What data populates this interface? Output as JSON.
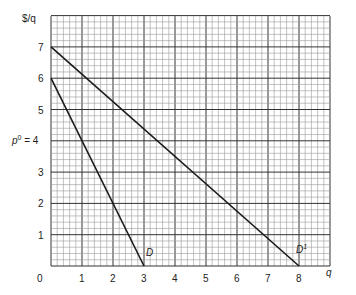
{
  "chart_data": {
    "type": "line",
    "title": "",
    "xlabel": "q",
    "ylabel": "$/q",
    "xlim": [
      0,
      9
    ],
    "ylim": [
      0,
      8
    ],
    "grid": true,
    "grid_minor_per_unit": 5,
    "x_ticks": [
      "0",
      "1",
      "2",
      "3",
      "4",
      "5",
      "6",
      "7",
      "8"
    ],
    "y_ticks": [
      "1",
      "2",
      "3",
      "p⁰ = 4",
      "5",
      "6",
      "7"
    ],
    "series": [
      {
        "name": "D",
        "points": [
          [
            0,
            6
          ],
          [
            3,
            0
          ]
        ]
      },
      {
        "name": "D¹",
        "points": [
          [
            0,
            7
          ],
          [
            8,
            0
          ]
        ]
      }
    ],
    "annotations": [
      {
        "text": "p⁰ = 4",
        "at": "y-axis label at 4"
      },
      {
        "text": "D",
        "near": [
          3,
          0.3
        ]
      },
      {
        "text": "D¹",
        "near": [
          8,
          0.3
        ]
      }
    ]
  },
  "labels": {
    "y_axis": "$/q",
    "x_axis": "q",
    "origin": "0",
    "p0_label": "p",
    "p0_sup": "0",
    "p0_value": " = 4",
    "curve_d": "D",
    "curve_d1": "D",
    "curve_d1_sup": "1"
  },
  "colors": {
    "grid_minor": "#9a9a9a",
    "grid_major": "#333333",
    "line": "#1a1a1a"
  }
}
